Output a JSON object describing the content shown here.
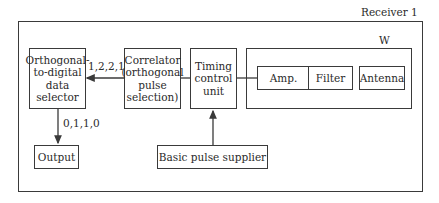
{
  "receiver": {
    "title": "Receiver 1"
  },
  "front_end": {
    "title": "W"
  },
  "blocks": {
    "selector": "Orthogonal-\nto-digital\ndata\nselector",
    "correlator": "Correlator\n(orthogonal\npulse\nselection)",
    "timing": "Timing\ncontrol\nunit",
    "amp": "Amp.",
    "filter": "Filter",
    "antenna": "Antenna",
    "output": "Output",
    "pulse_supplier": "Basic pulse supplier"
  },
  "signals": {
    "correlator_to_selector": "1,2,2,1",
    "selector_to_output": "0,1,1,0"
  },
  "colors": {
    "line": "#3a3a3a",
    "background": "#ffffff"
  }
}
